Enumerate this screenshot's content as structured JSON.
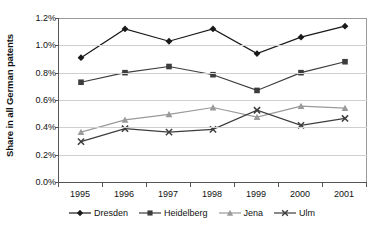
{
  "chart_data": {
    "type": "line",
    "title": "",
    "xlabel": "",
    "ylabel": "Share in all German patents",
    "categories": [
      "1995",
      "1996",
      "1997",
      "1998",
      "1999",
      "2000",
      "2001"
    ],
    "x": [
      1995,
      1996,
      1997,
      1998,
      1999,
      2000,
      2001
    ],
    "ylim": [
      0.0,
      1.2
    ],
    "yticks": [
      0.0,
      0.2,
      0.4,
      0.6,
      0.8,
      1.0,
      1.2
    ],
    "ytick_labels": [
      "0.0%",
      "0.2%",
      "0.4%",
      "0.6%",
      "0.8%",
      "1.0%",
      "1.2%"
    ],
    "yunit": "%",
    "grid": true,
    "legend_position": "bottom",
    "series": [
      {
        "name": "Dresden",
        "marker": "diamond",
        "color": "#1a1a1a",
        "values": [
          0.91,
          1.12,
          1.03,
          1.12,
          0.94,
          1.06,
          1.14
        ]
      },
      {
        "name": "Heidelberg",
        "marker": "square",
        "color": "#3d3d3d",
        "values": [
          0.73,
          0.8,
          0.845,
          0.785,
          0.67,
          0.8,
          0.88
        ]
      },
      {
        "name": "Jena",
        "marker": "triangle",
        "color": "#9a9a9a",
        "values": [
          0.365,
          0.455,
          0.495,
          0.545,
          0.475,
          0.555,
          0.54
        ]
      },
      {
        "name": "Ulm",
        "marker": "x",
        "color": "#3d3d3d",
        "values": [
          0.295,
          0.39,
          0.365,
          0.385,
          0.525,
          0.415,
          0.465
        ]
      }
    ]
  },
  "colors": {
    "axis": "#555555",
    "grid": "#cfcfcf",
    "background": "#ffffff",
    "text": "#111111"
  }
}
